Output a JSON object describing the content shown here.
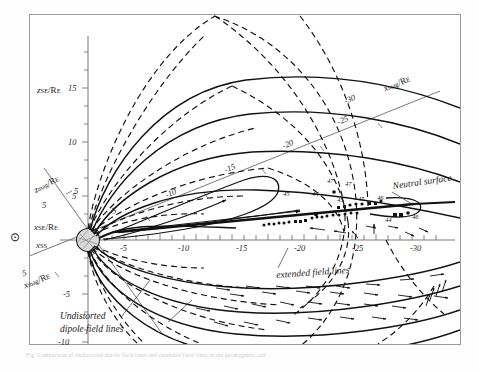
{
  "figure": {
    "type": "scientific-diagram",
    "caption_faint": "Fig.  Comparison of undistorted dipole field lines and extended field lines in the geomagnetic tail"
  },
  "axes": {
    "vertical": {
      "label_main": "z",
      "label_sub": "SE",
      "label_den": "/R",
      "label_den_sub": "E",
      "full": "z_SE/R_E",
      "ticks_positive": [
        "15",
        "10",
        "5"
      ],
      "ticks_negative": [
        "-5",
        "-10"
      ]
    },
    "horizontal": {
      "label_main": "x",
      "label_sub": "SE",
      "full": "x_SE/R_E",
      "ticks": [
        "-5",
        "-10",
        "-15",
        "-20",
        "-25",
        "-30"
      ]
    },
    "oblique_x": {
      "full": "x_mag/R_E",
      "label_main": "x",
      "label_sub": "mag",
      "ticks": [
        "5",
        "-5",
        "-10",
        "-15",
        "-20",
        "-25",
        "-30"
      ]
    },
    "oblique_z": {
      "full": "z_mag/R_E",
      "label_main": "z",
      "label_sub": "mag",
      "ticks": [
        "5"
      ]
    },
    "sun_direction_label": "x",
    "sun_direction_sub": "SS"
  },
  "annotations": [
    {
      "id": "neutral-surface",
      "text": "Neutral surface"
    },
    {
      "id": "extended-field-lines",
      "text": "extended field lines"
    },
    {
      "id": "undistorted-dipole",
      "line1": "Undistorted",
      "line2": "dipole field lines"
    }
  ],
  "data_point_labels": [
    {
      "id": "p45a",
      "text": "45"
    },
    {
      "id": "p44a",
      "text": "44"
    },
    {
      "id": "p47a",
      "text": "47"
    },
    {
      "id": "p47b",
      "text": "47"
    },
    {
      "id": "p45b",
      "text": "45"
    },
    {
      "id": "p45c",
      "text": "45"
    },
    {
      "id": "p46a",
      "text": "46"
    },
    {
      "id": "p44b",
      "text": "44"
    },
    {
      "id": "p46b",
      "text": "46"
    }
  ],
  "icons": {
    "sun_symbol": "⊙"
  },
  "colors": {
    "ink": "#111111",
    "frame": "#9a9a9a",
    "axis": "#5a5a5a",
    "faint": "#c9c9c9"
  }
}
